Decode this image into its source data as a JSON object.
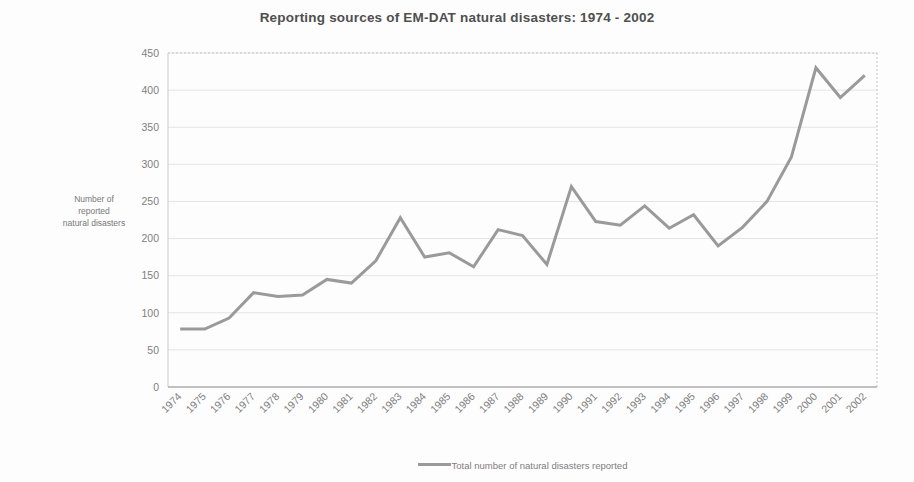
{
  "chart_data": {
    "type": "line",
    "title": "Reporting sources of EM-DAT natural disasters: 1974 - 2002",
    "ylabel": "Number of reported natural disasters",
    "ylabel_lines": [
      "Number of",
      "reported",
      "natural disasters"
    ],
    "xlabel": "",
    "x": [
      "1974",
      "1975",
      "1976",
      "1977",
      "1978",
      "1979",
      "1980",
      "1981",
      "1982",
      "1983",
      "1984",
      "1985",
      "1986",
      "1987",
      "1988",
      "1989",
      "1990",
      "1991",
      "1992",
      "1993",
      "1994",
      "1995",
      "1996",
      "1997",
      "1998",
      "1999",
      "2000",
      "2001",
      "2002"
    ],
    "series": [
      {
        "name": "Total number of natural disasters reported",
        "values": [
          78,
          78,
          93,
          127,
          122,
          124,
          145,
          140,
          170,
          228,
          175,
          181,
          162,
          212,
          204,
          165,
          270,
          223,
          218,
          244,
          214,
          232,
          190,
          215,
          250,
          310,
          430,
          390,
          420
        ]
      }
    ],
    "ylim": [
      0,
      450
    ],
    "y_ticks": [
      0,
      50,
      100,
      150,
      200,
      250,
      300,
      350,
      400,
      450
    ],
    "grid": "horizontal",
    "legend_position": "bottom",
    "colors": {
      "line": "#9a9a9a",
      "grid": "#e4e4e4",
      "border_dotted": "#c4c4c4",
      "axis_solid": "#ababab",
      "title_text": "#4f4f4f",
      "tick_text": "#7f7f7f",
      "legend_text": "#7d7d7d",
      "background": "#fdfdfd"
    }
  }
}
